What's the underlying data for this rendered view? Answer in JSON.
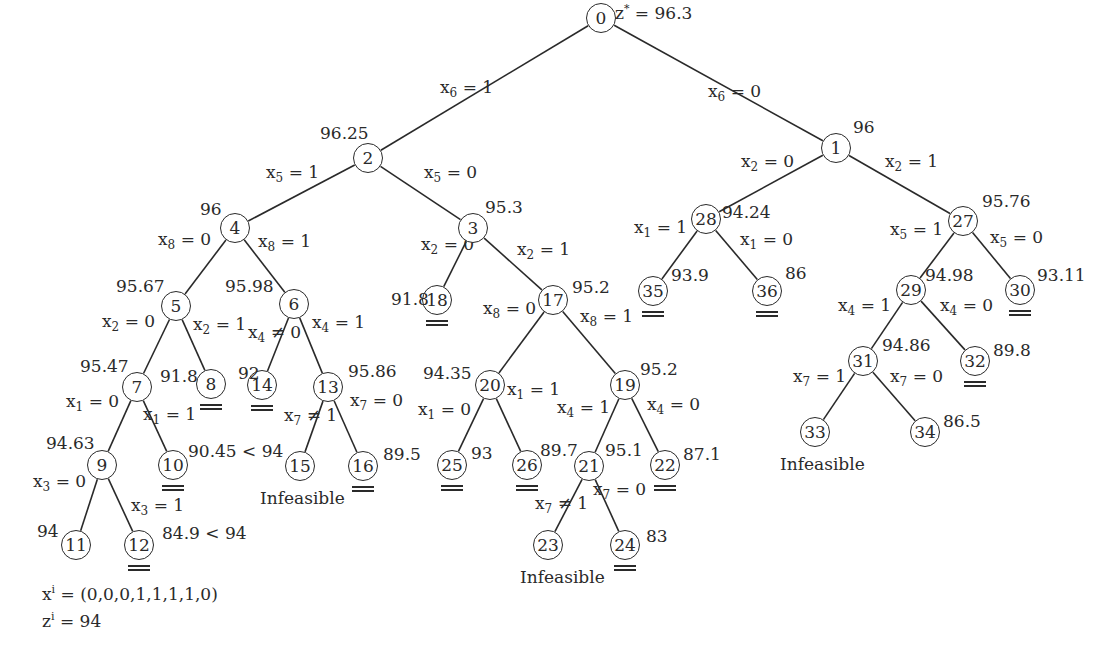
{
  "diagram": {
    "root_label": "z* = 96.3",
    "nodes": [
      {
        "id": "0",
        "x": 601,
        "y": 18,
        "bound": "z* = 96.3",
        "bx": 615,
        "by": -5,
        "status": ""
      },
      {
        "id": "1",
        "x": 836,
        "y": 148,
        "bound": "96",
        "bx": 853,
        "by": 118,
        "status": ""
      },
      {
        "id": "2",
        "x": 368,
        "y": 158,
        "bound": "96.25",
        "bx": 320,
        "by": 124,
        "status": ""
      },
      {
        "id": "3",
        "x": 473,
        "y": 228,
        "bound": "95.3",
        "bx": 485,
        "by": 198,
        "status": ""
      },
      {
        "id": "4",
        "x": 235,
        "y": 228,
        "bound": "96",
        "bx": 200,
        "by": 200,
        "status": ""
      },
      {
        "id": "5",
        "x": 176,
        "y": 306,
        "bound": "95.67",
        "bx": 116,
        "by": 277,
        "status": ""
      },
      {
        "id": "6",
        "x": 294,
        "y": 304,
        "bound": "95.98",
        "bx": 225,
        "by": 277,
        "status": ""
      },
      {
        "id": "7",
        "x": 137,
        "y": 387,
        "bound": "95.47",
        "bx": 80,
        "by": 357,
        "status": ""
      },
      {
        "id": "8",
        "x": 211,
        "y": 384,
        "bound": "91.8",
        "bx": 160,
        "by": 367,
        "status": "fathomed"
      },
      {
        "id": "14",
        "x": 262,
        "y": 385,
        "bound": "92",
        "bx": 238,
        "by": 364,
        "status": "fathomed"
      },
      {
        "id": "13",
        "x": 328,
        "y": 387,
        "bound": "95.86",
        "bx": 348,
        "by": 362,
        "status": ""
      },
      {
        "id": "9",
        "x": 102,
        "y": 465,
        "bound": "94.63",
        "bx": 46,
        "by": 434,
        "status": ""
      },
      {
        "id": "10",
        "x": 173,
        "y": 465,
        "bound": "90.45 < 94",
        "bx": 188,
        "by": 442,
        "status": "fathomed"
      },
      {
        "id": "15",
        "x": 300,
        "y": 466,
        "bound": "",
        "bx": 0,
        "by": 0,
        "status": "infeasible"
      },
      {
        "id": "16",
        "x": 363,
        "y": 466,
        "bound": "89.5",
        "bx": 383,
        "by": 445,
        "status": "fathomed"
      },
      {
        "id": "11",
        "x": 76,
        "y": 545,
        "bound": "94",
        "bx": 37,
        "by": 522,
        "status": "incumbent"
      },
      {
        "id": "12",
        "x": 139,
        "y": 545,
        "bound": "84.9 < 94",
        "bx": 162,
        "by": 524,
        "status": "fathomed"
      },
      {
        "id": "18",
        "x": 437,
        "y": 300,
        "bound": "91.8",
        "bx": 391,
        "by": 290,
        "status": "fathomed"
      },
      {
        "id": "17",
        "x": 553,
        "y": 300,
        "bound": "95.2",
        "bx": 572,
        "by": 278,
        "status": ""
      },
      {
        "id": "20",
        "x": 490,
        "y": 385,
        "bound": "94.35",
        "bx": 423,
        "by": 364,
        "status": ""
      },
      {
        "id": "19",
        "x": 625,
        "y": 385,
        "bound": "95.2",
        "bx": 640,
        "by": 360,
        "status": ""
      },
      {
        "id": "25",
        "x": 452,
        "y": 465,
        "bound": "93",
        "bx": 471,
        "by": 444,
        "status": "fathomed"
      },
      {
        "id": "26",
        "x": 527,
        "y": 465,
        "bound": "89.7",
        "bx": 540,
        "by": 441,
        "status": "fathomed"
      },
      {
        "id": "21",
        "x": 589,
        "y": 466,
        "bound": "95.1",
        "bx": 605,
        "by": 441,
        "status": ""
      },
      {
        "id": "22",
        "x": 665,
        "y": 465,
        "bound": "87.1",
        "bx": 683,
        "by": 445,
        "status": "fathomed"
      },
      {
        "id": "23",
        "x": 548,
        "y": 545,
        "bound": "",
        "bx": 0,
        "by": 0,
        "status": "infeasible"
      },
      {
        "id": "24",
        "x": 625,
        "y": 545,
        "bound": "83",
        "bx": 646,
        "by": 527,
        "status": "fathomed"
      },
      {
        "id": "28",
        "x": 706,
        "y": 219,
        "bound": "94.24",
        "bx": 722,
        "by": 203,
        "status": ""
      },
      {
        "id": "27",
        "x": 963,
        "y": 221,
        "bound": "95.76",
        "bx": 982,
        "by": 192,
        "status": ""
      },
      {
        "id": "35",
        "x": 653,
        "y": 291,
        "bound": "93.9",
        "bx": 671,
        "by": 266,
        "status": "fathomed"
      },
      {
        "id": "36",
        "x": 767,
        "y": 291,
        "bound": "86",
        "bx": 785,
        "by": 264,
        "status": "fathomed"
      },
      {
        "id": "29",
        "x": 911,
        "y": 290,
        "bound": "94.98",
        "bx": 925,
        "by": 266,
        "status": ""
      },
      {
        "id": "30",
        "x": 1020,
        "y": 290,
        "bound": "93.11",
        "bx": 1037,
        "by": 266,
        "status": "fathomed"
      },
      {
        "id": "31",
        "x": 863,
        "y": 361,
        "bound": "94.86",
        "bx": 882,
        "by": 336,
        "status": ""
      },
      {
        "id": "32",
        "x": 975,
        "y": 361,
        "bound": "89.8",
        "bx": 993,
        "by": 341,
        "status": "fathomed"
      },
      {
        "id": "33",
        "x": 815,
        "y": 432,
        "bound": "",
        "bx": 0,
        "by": 0,
        "status": "infeasible"
      },
      {
        "id": "34",
        "x": 925,
        "y": 432,
        "bound": "86.5",
        "bx": 943,
        "by": 412,
        "status": ""
      }
    ],
    "edges": [
      {
        "from": "0",
        "to": "2",
        "var": "6",
        "val": "1",
        "lx": 440,
        "ly": 78,
        "op": "="
      },
      {
        "from": "0",
        "to": "1",
        "var": "6",
        "val": "0",
        "lx": 708,
        "ly": 82,
        "op": "="
      },
      {
        "from": "2",
        "to": "4",
        "var": "5",
        "val": "1",
        "lx": 266,
        "ly": 163,
        "op": "="
      },
      {
        "from": "2",
        "to": "3",
        "var": "5",
        "val": "0",
        "lx": 424,
        "ly": 163,
        "op": "="
      },
      {
        "from": "4",
        "to": "5",
        "var": "8",
        "val": "0",
        "lx": 158,
        "ly": 230,
        "op": "="
      },
      {
        "from": "4",
        "to": "6",
        "var": "8",
        "val": "1",
        "lx": 258,
        "ly": 232,
        "op": "="
      },
      {
        "from": "5",
        "to": "7",
        "var": "2",
        "val": "0",
        "lx": 102,
        "ly": 312,
        "op": "="
      },
      {
        "from": "5",
        "to": "8",
        "var": "2",
        "val": "1",
        "lx": 193,
        "ly": 315,
        "op": "="
      },
      {
        "from": "6",
        "to": "14",
        "var": "4",
        "val": "0",
        "lx": 248,
        "ly": 323,
        "op": "≠"
      },
      {
        "from": "6",
        "to": "13",
        "var": "4",
        "val": "1",
        "lx": 312,
        "ly": 313,
        "op": "="
      },
      {
        "from": "7",
        "to": "9",
        "var": "1",
        "val": "0",
        "lx": 66,
        "ly": 392,
        "op": "="
      },
      {
        "from": "7",
        "to": "10",
        "var": "1",
        "val": "1",
        "lx": 143,
        "ly": 405,
        "op": "="
      },
      {
        "from": "13",
        "to": "15",
        "var": "7",
        "val": "1",
        "lx": 284,
        "ly": 406,
        "op": "≠"
      },
      {
        "from": "13",
        "to": "16",
        "var": "7",
        "val": "0",
        "lx": 350,
        "ly": 391,
        "op": "="
      },
      {
        "from": "9",
        "to": "11",
        "var": "3",
        "val": "0",
        "lx": 33,
        "ly": 472,
        "op": "="
      },
      {
        "from": "9",
        "to": "12",
        "var": "3",
        "val": "1",
        "lx": 131,
        "ly": 496,
        "op": "="
      },
      {
        "from": "3",
        "to": "18",
        "var": "2",
        "val": "0",
        "lx": 421,
        "ly": 235,
        "op": "="
      },
      {
        "from": "3",
        "to": "17",
        "var": "2",
        "val": "1",
        "lx": 517,
        "ly": 240,
        "op": "="
      },
      {
        "from": "17",
        "to": "20",
        "var": "8",
        "val": "0",
        "lx": 483,
        "ly": 299,
        "op": "="
      },
      {
        "from": "17",
        "to": "19",
        "var": "8",
        "val": "1",
        "lx": 580,
        "ly": 307,
        "op": "="
      },
      {
        "from": "20",
        "to": "25",
        "var": "1",
        "val": "0",
        "lx": 418,
        "ly": 400,
        "op": "="
      },
      {
        "from": "20",
        "to": "26",
        "var": "1",
        "val": "1",
        "lx": 507,
        "ly": 380,
        "op": "="
      },
      {
        "from": "19",
        "to": "21",
        "var": "4",
        "val": "1",
        "lx": 557,
        "ly": 398,
        "op": "="
      },
      {
        "from": "19",
        "to": "22",
        "var": "4",
        "val": "0",
        "lx": 647,
        "ly": 395,
        "op": "="
      },
      {
        "from": "21",
        "to": "23",
        "var": "7",
        "val": "1",
        "lx": 535,
        "ly": 494,
        "op": "≠"
      },
      {
        "from": "21",
        "to": "24",
        "var": "7",
        "val": "0",
        "lx": 593,
        "ly": 480,
        "op": "="
      },
      {
        "from": "1",
        "to": "28",
        "var": "2",
        "val": "0",
        "lx": 741,
        "ly": 152,
        "op": "="
      },
      {
        "from": "1",
        "to": "27",
        "var": "2",
        "val": "1",
        "lx": 885,
        "ly": 152,
        "op": "="
      },
      {
        "from": "28",
        "to": "35",
        "var": "1",
        "val": "1",
        "lx": 634,
        "ly": 218,
        "op": "="
      },
      {
        "from": "28",
        "to": "36",
        "var": "1",
        "val": "0",
        "lx": 740,
        "ly": 230,
        "op": "="
      },
      {
        "from": "27",
        "to": "29",
        "var": "5",
        "val": "1",
        "lx": 890,
        "ly": 220,
        "op": "="
      },
      {
        "from": "27",
        "to": "30",
        "var": "5",
        "val": "0",
        "lx": 990,
        "ly": 228,
        "op": "="
      },
      {
        "from": "29",
        "to": "31",
        "var": "4",
        "val": "1",
        "lx": 838,
        "ly": 296,
        "op": "="
      },
      {
        "from": "29",
        "to": "32",
        "var": "4",
        "val": "0",
        "lx": 940,
        "ly": 296,
        "op": "="
      },
      {
        "from": "31",
        "to": "33",
        "var": "7",
        "val": "1",
        "lx": 793,
        "ly": 367,
        "op": "="
      },
      {
        "from": "31",
        "to": "34",
        "var": "7",
        "val": "0",
        "lx": 890,
        "ly": 367,
        "op": "="
      }
    ],
    "infeasible_label": "Infeasible",
    "infeasible_labels": [
      {
        "node": "15",
        "x": 260,
        "y": 489
      },
      {
        "node": "23",
        "x": 520,
        "y": 568
      },
      {
        "node": "33",
        "x": 780,
        "y": 455
      }
    ],
    "incumbent": {
      "x_label": "x",
      "x_value": "(0,0,0,1,1,1,1,0)",
      "z_label": "z",
      "z_value": "94",
      "superscript": "i"
    }
  }
}
